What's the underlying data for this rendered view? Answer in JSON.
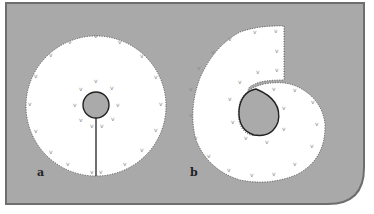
{
  "figure": {
    "background_color": "#a9a9a9",
    "frame_color": "#6e6e6e",
    "shape_fill": "#ffffff",
    "hole_fill": "#aaaaaa",
    "panels": [
      {
        "label": "a",
        "description": "annular disc with central hole and radial cut"
      },
      {
        "label": "b",
        "description": "curled disc: cut opened and wrapped into spiral"
      }
    ],
    "marker_glyph": "v"
  }
}
